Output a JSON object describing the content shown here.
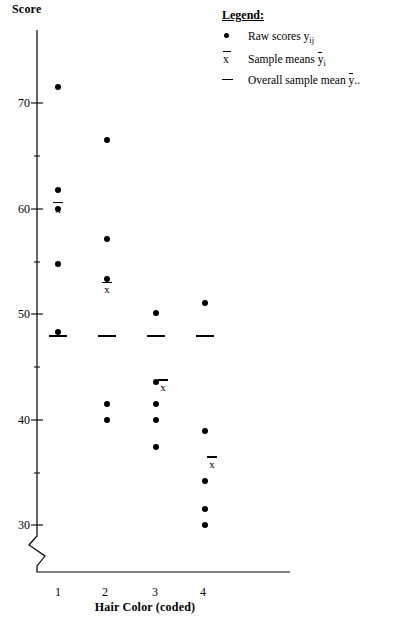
{
  "axes": {
    "ylabel": "Score",
    "xlabel": "Hair Color (coded)",
    "yticks": [
      30,
      40,
      50,
      60,
      70
    ],
    "xticks": [
      "1",
      "2",
      "3",
      "4"
    ]
  },
  "legend": {
    "title": "Legend:",
    "items": [
      {
        "symbol": "dot",
        "text_prefix": "Raw scores ",
        "var": "y",
        "sub": "ij"
      },
      {
        "symbol": "xbar",
        "text_prefix": "Sample means ",
        "var": "y",
        "sub": "i"
      },
      {
        "symbol": "dash",
        "text_prefix": "Overall sample mean ",
        "var": "y",
        "sub": ".."
      }
    ]
  },
  "chart_data": {
    "type": "scatter",
    "title": "",
    "xlabel": "Hair Color (coded)",
    "ylabel": "Score",
    "xlim": [
      0.5,
      4.5
    ],
    "ylim": [
      28,
      73
    ],
    "ytick_values": [
      30,
      40,
      50,
      60,
      70
    ],
    "xtick_values": [
      1,
      2,
      3,
      4
    ],
    "axis_break": true,
    "grid": false,
    "legend_position": "top-right",
    "groups": [
      {
        "category": "1",
        "x": 1,
        "values": [
          71.5,
          61.8,
          60.0,
          54.7,
          48.3
        ],
        "mean": 59.3
      },
      {
        "category": "2",
        "x": 2,
        "values": [
          66.5,
          57.1,
          53.3,
          41.5,
          40.0
        ],
        "mean": 51.7
      },
      {
        "category": "3",
        "x": 3,
        "values": [
          50.1,
          43.6,
          41.5,
          40.0,
          37.4
        ],
        "mean": 42.5
      },
      {
        "category": "4",
        "x": 4,
        "values": [
          51.0,
          38.9,
          34.2,
          31.5,
          30.0
        ],
        "mean": 35.2
      }
    ],
    "overall_mean": 48.0,
    "overall_mean_label": "Overall sample mean"
  }
}
